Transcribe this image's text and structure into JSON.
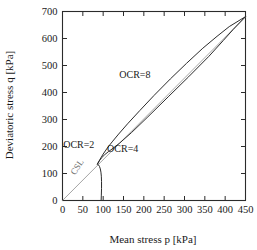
{
  "chart_data": {
    "type": "line",
    "title": "",
    "xlabel": "Mean stress p [kPa]",
    "ylabel": "Deviatoric stress q [kPa]",
    "xlim": [
      0,
      450
    ],
    "ylim": [
      0,
      700
    ],
    "xticks": [
      0,
      50,
      100,
      150,
      200,
      250,
      300,
      350,
      400,
      450
    ],
    "yticks": [
      0,
      100,
      200,
      300,
      400,
      500,
      600,
      700
    ],
    "xtick_labels": [
      "0",
      "50",
      "100",
      "150",
      "200",
      "250",
      "300",
      "350",
      "400",
      "450"
    ],
    "ytick_labels": [
      "0",
      "100",
      "200",
      "300",
      "400",
      "500",
      "600",
      "700"
    ],
    "grid": false,
    "legend_position": "inline-annotations",
    "series": [
      {
        "name": "CSL",
        "label": "CSL",
        "color": "#9a9a9a",
        "label_color": "#6e6e6e",
        "label_x": 42,
        "label_y": 118,
        "label_rotation": -56,
        "points": [
          [
            0,
            0
          ],
          [
            450,
            680
          ]
        ]
      },
      {
        "name": "OCR=2",
        "label": "OCR=2",
        "color": "#2b2b2b",
        "label_x": 40,
        "label_y": 196,
        "points": [
          [
            95,
            0
          ],
          [
            95.5,
            20
          ],
          [
            96,
            45
          ],
          [
            96,
            70
          ],
          [
            95.5,
            90
          ],
          [
            94.5,
            105
          ],
          [
            93,
            117
          ],
          [
            91,
            126
          ],
          [
            88.5,
            132
          ],
          [
            86,
            135
          ]
        ]
      },
      {
        "name": "OCR=4",
        "label": "OCR=4",
        "color": "#2b2b2b",
        "label_x": 148,
        "label_y": 178,
        "points": [
          [
            86,
            135
          ],
          [
            90,
            146
          ],
          [
            96,
            158
          ],
          [
            104,
            170
          ],
          [
            113,
            181
          ],
          [
            124,
            193
          ],
          [
            140,
            212
          ],
          [
            170,
            252
          ],
          [
            210,
            310
          ],
          [
            260,
            384
          ],
          [
            310,
            458
          ],
          [
            360,
            534
          ],
          [
            395,
            592
          ],
          [
            420,
            634
          ],
          [
            450,
            681
          ]
        ]
      },
      {
        "name": "OCR=8",
        "label": "OCR=8",
        "color": "#2b2b2b",
        "label_x": 178,
        "label_y": 452,
        "points": [
          [
            86,
            135
          ],
          [
            92,
            152
          ],
          [
            100,
            172
          ],
          [
            110,
            194
          ],
          [
            122,
            217
          ],
          [
            138,
            246
          ],
          [
            160,
            284
          ],
          [
            190,
            333
          ],
          [
            225,
            389
          ],
          [
            265,
            450
          ],
          [
            305,
            508
          ],
          [
            345,
            564
          ],
          [
            380,
            608
          ],
          [
            410,
            644
          ],
          [
            450,
            681
          ]
        ]
      }
    ],
    "annotations": [
      {
        "text": "OCR=2",
        "x": 40,
        "y": 196
      },
      {
        "text": "OCR=4",
        "x": 148,
        "y": 178
      },
      {
        "text": "OCR=8",
        "x": 178,
        "y": 452
      },
      {
        "text": "CSL",
        "x": 42,
        "y": 118
      }
    ]
  }
}
